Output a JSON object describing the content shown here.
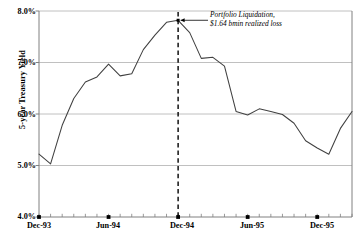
{
  "chart_data": {
    "type": "line",
    "title": "",
    "xlabel": "",
    "ylabel": "5-year Treasury Yield",
    "ylim": [
      4.0,
      8.0
    ],
    "yticks": [
      "4.0%",
      "5.0%",
      "6.0%",
      "7.0%",
      "8.0%"
    ],
    "ytick_values": [
      4.0,
      5.0,
      6.0,
      7.0,
      8.0
    ],
    "grid": true,
    "legend": null,
    "xticks": [
      "Dec-93",
      "Jun-94",
      "Dec-94",
      "Jun-95",
      "Dec-95"
    ],
    "xtick_values": [
      "1993-12",
      "1994-06",
      "1994-12",
      "1995-06",
      "1995-12"
    ],
    "x": [
      "Dec-93",
      "Jan-94",
      "Feb-94",
      "Mar-94",
      "Apr-94",
      "May-94",
      "Jun-94",
      "Jul-94",
      "Aug-94",
      "Sep-94",
      "Oct-94",
      "Nov-94",
      "Dec-94",
      "Jan-95",
      "Feb-95",
      "Mar-95",
      "Apr-95",
      "May-95",
      "Jun-95",
      "Jul-95",
      "Aug-95",
      "Sep-95",
      "Oct-95",
      "Nov-95",
      "Dec-95",
      "Jan-96",
      "Feb-96",
      "Mar-96"
    ],
    "series": [
      {
        "name": "5-year Treasury Yield",
        "values": [
          5.22,
          5.03,
          5.78,
          6.3,
          6.62,
          6.72,
          6.97,
          6.74,
          6.78,
          7.25,
          7.53,
          7.78,
          7.82,
          7.58,
          7.08,
          7.1,
          6.93,
          6.05,
          5.98,
          6.1,
          6.05,
          5.99,
          5.82,
          5.48,
          5.34,
          5.22,
          5.72,
          6.05
        ]
      }
    ],
    "annotations": [
      {
        "name": "portfolio-liquidation",
        "lines": [
          "Portfolio Liquidation,",
          "$1.64 bmin realized loss"
        ],
        "at_x": "Dec-94",
        "at_y": 7.82,
        "style": "italic",
        "has_arrow": true
      }
    ],
    "vertical_marker": {
      "name": "dec-94-marker",
      "at_x": "Dec-94",
      "style": "dashed",
      "color": "#000000"
    },
    "line_color": "#404040",
    "grid_color": "#b0b0b0",
    "axis_color": "#808080"
  }
}
